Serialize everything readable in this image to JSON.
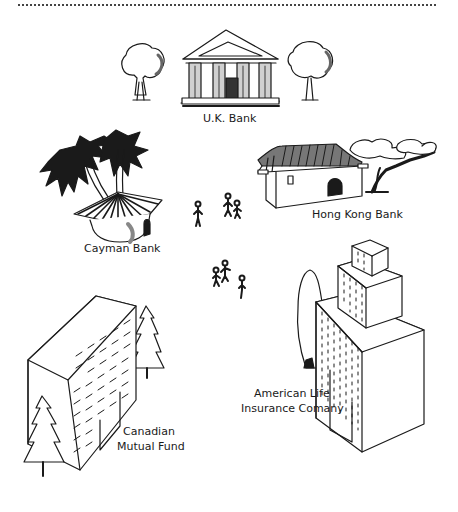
{
  "illustration": {
    "colors": {
      "ink": "#1a1a1a",
      "paper": "#ffffff",
      "shade": "#6a6a6a"
    },
    "labels": {
      "uk_bank": "U.K. Bank",
      "cayman_bank": "Cayman Bank",
      "hong_kong_bank": "Hong Kong Bank",
      "american_life_line1": "American Life",
      "american_life_line2": "Insurance Comany",
      "canadian_fund_line1": "Canadian",
      "canadian_fund_line2": "Mutual Fund"
    }
  }
}
